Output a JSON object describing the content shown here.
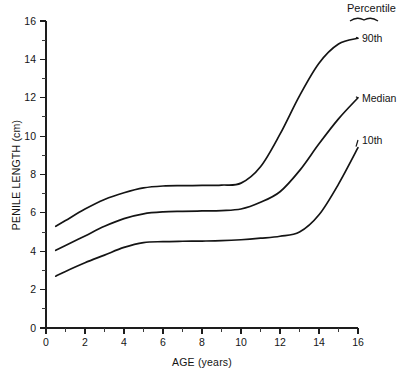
{
  "chart_data": {
    "type": "line",
    "title": "",
    "xlabel": "AGE (years)",
    "ylabel": "PENILE LENGTH (cm)",
    "xlim": [
      0,
      16
    ],
    "ylim": [
      0,
      16
    ],
    "xticks": [
      0,
      2,
      4,
      6,
      8,
      10,
      12,
      14,
      16
    ],
    "yticks": [
      0,
      2,
      4,
      6,
      8,
      10,
      12,
      14,
      16
    ],
    "xtick_labels": [
      "0",
      "2",
      "4",
      "6",
      "8",
      "10",
      "12",
      "14",
      "16"
    ],
    "ytick_labels": [
      "0",
      "2",
      "4",
      "6",
      "8",
      "10",
      "12",
      "14",
      "16"
    ],
    "x_minor_step": 1,
    "y_minor_step": 1,
    "grid": false,
    "legend_position": "right-inline",
    "legend_title": "Percentile",
    "x": [
      0.5,
      1,
      2,
      3,
      4,
      5,
      6,
      7,
      8,
      9,
      10,
      11,
      12,
      13,
      14,
      15,
      16
    ],
    "series": [
      {
        "name": "90th",
        "label": "90th",
        "values": [
          5.3,
          5.6,
          6.2,
          6.7,
          7.05,
          7.3,
          7.4,
          7.42,
          7.43,
          7.45,
          7.55,
          8.4,
          10.1,
          12.1,
          13.8,
          14.8,
          15.1
        ]
      },
      {
        "name": "Median",
        "label": "Median",
        "values": [
          4.05,
          4.3,
          4.8,
          5.3,
          5.7,
          5.95,
          6.05,
          6.08,
          6.1,
          6.12,
          6.2,
          6.55,
          7.1,
          8.2,
          9.6,
          10.9,
          12.0
        ]
      },
      {
        "name": "10th",
        "label": "10th",
        "values": [
          2.7,
          2.95,
          3.4,
          3.8,
          4.2,
          4.45,
          4.5,
          4.52,
          4.53,
          4.55,
          4.6,
          4.68,
          4.78,
          5.0,
          5.9,
          7.5,
          9.4
        ]
      }
    ]
  },
  "axes": {
    "x_title": "AGE (years)",
    "y_title": "PENILE LENGTH (cm)"
  },
  "legend": {
    "title": "Percentile",
    "entries": [
      {
        "label": "90th"
      },
      {
        "label": "Median"
      },
      {
        "label": "10th"
      }
    ]
  },
  "ticks": {
    "x": [
      "0",
      "2",
      "4",
      "6",
      "8",
      "10",
      "12",
      "14",
      "16"
    ],
    "y": [
      "0",
      "2",
      "4",
      "6",
      "8",
      "10",
      "12",
      "14",
      "16"
    ]
  }
}
